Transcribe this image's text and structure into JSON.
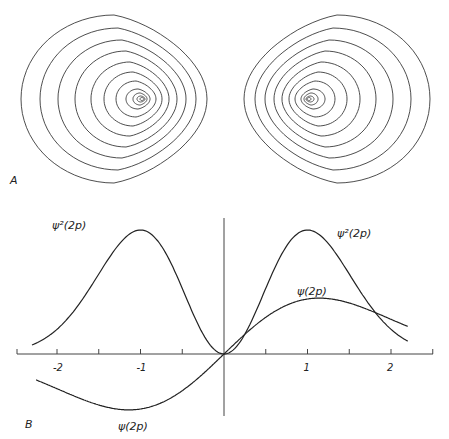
{
  "figure": {
    "panel_a_label": "A",
    "panel_b_label": "B"
  },
  "labels": {
    "psi2_left": "ψ²(2p)",
    "psi2_right": "ψ²(2p)",
    "psi_right": "ψ(2p)",
    "psi_left": "ψ(2p)"
  },
  "contours": {
    "left": {
      "center": [
        141,
        99
      ],
      "rings": [
        {
          "rx": 93,
          "ry": 84,
          "cx": 114,
          "cy": 99
        },
        {
          "rx": 78,
          "ry": 71,
          "cx": 118,
          "cy": 99
        },
        {
          "rx": 64,
          "ry": 59,
          "cx": 122,
          "cy": 99
        },
        {
          "rx": 51,
          "ry": 48,
          "cx": 126,
          "cy": 99
        },
        {
          "rx": 39,
          "ry": 37,
          "cx": 130,
          "cy": 99
        },
        {
          "rx": 29,
          "ry": 27,
          "cx": 133,
          "cy": 99
        },
        {
          "rx": 20,
          "ry": 18,
          "cx": 136,
          "cy": 99
        },
        {
          "rx": 12,
          "ry": 10,
          "cx": 138,
          "cy": 99
        },
        {
          "rx": 7,
          "ry": 6,
          "cx": 140,
          "cy": 99
        },
        {
          "rx": 4,
          "ry": 3,
          "cx": 141,
          "cy": 99
        },
        {
          "rx": 2,
          "ry": 1.5,
          "cx": 142,
          "cy": 99
        }
      ]
    },
    "right": {
      "center": [
        310,
        99
      ],
      "rings": [
        {
          "rx": 93,
          "ry": 84,
          "cx": 337,
          "cy": 99
        },
        {
          "rx": 78,
          "ry": 71,
          "cx": 333,
          "cy": 99
        },
        {
          "rx": 64,
          "ry": 59,
          "cx": 329,
          "cy": 99
        },
        {
          "rx": 51,
          "ry": 48,
          "cx": 325,
          "cy": 99
        },
        {
          "rx": 39,
          "ry": 37,
          "cx": 321,
          "cy": 99
        },
        {
          "rx": 29,
          "ry": 27,
          "cx": 318,
          "cy": 99
        },
        {
          "rx": 20,
          "ry": 18,
          "cx": 315,
          "cy": 99
        },
        {
          "rx": 12,
          "ry": 10,
          "cx": 313,
          "cy": 99
        },
        {
          "rx": 7,
          "ry": 6,
          "cx": 311,
          "cy": 99
        },
        {
          "rx": 4,
          "ry": 3,
          "cx": 310,
          "cy": 99
        },
        {
          "rx": 2,
          "ry": 1.5,
          "cx": 309,
          "cy": 99
        }
      ]
    }
  },
  "chart_data": {
    "type": "line",
    "title": "",
    "xlabel": "",
    "ylabel": "",
    "xlim": [
      -2.5,
      2.5
    ],
    "x_ticks": [
      -2,
      -1.5,
      -1,
      -0.5,
      0,
      0.5,
      1,
      1.5,
      2,
      2.5
    ],
    "x_tick_labels": [
      {
        "x": -2,
        "label": "-2"
      },
      {
        "x": -1,
        "label": "-1"
      },
      {
        "x": 1,
        "label": "1"
      },
      {
        "x": 2,
        "label": "2"
      }
    ],
    "grid": false,
    "legend": "inline labels",
    "series": [
      {
        "name": "ψ²(2p)",
        "x": [
          -2.3,
          -2.0,
          -1.75,
          -1.5,
          -1.25,
          -1.0,
          -0.75,
          -0.5,
          -0.25,
          0.0,
          0.25,
          0.5,
          0.75,
          1.0,
          1.25,
          1.5,
          1.75,
          2.0,
          2.2
        ],
        "values": [
          0.0,
          0.06,
          0.2,
          0.5,
          0.85,
          1.0,
          0.85,
          0.5,
          0.16,
          0.0,
          0.16,
          0.5,
          0.85,
          1.0,
          0.85,
          0.5,
          0.2,
          0.06,
          0.0
        ]
      },
      {
        "name": "ψ(2p)",
        "x": [
          -2.25,
          -2.0,
          -1.5,
          -1.0,
          -0.5,
          0.0,
          0.5,
          1.0,
          1.5,
          2.0,
          2.2
        ],
        "values": [
          -0.4,
          -0.5,
          -0.75,
          -1.0,
          -0.72,
          0.0,
          0.72,
          1.0,
          0.78,
          0.45,
          0.38
        ]
      }
    ]
  }
}
